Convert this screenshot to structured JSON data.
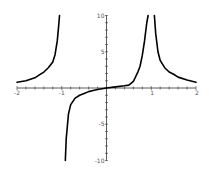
{
  "chart_data": {
    "type": "line",
    "title": "",
    "xlabel": "",
    "ylabel": "",
    "xlim": [
      -2,
      2
    ],
    "ylim": [
      -10,
      10
    ],
    "grid": false,
    "legend": null,
    "x_ticks": [
      "-2",
      "-1",
      "1",
      "2"
    ],
    "y_ticks": [
      "10",
      "5",
      "-5",
      "-10"
    ],
    "vertical_asymptotes": [
      -1,
      1
    ],
    "series": [
      {
        "name": "f(x)",
        "color": "#000000",
        "branches": [
          {
            "x": [
              -2,
              -1.8,
              -1.6,
              -1.5,
              -1.4,
              -1.3,
              -1.2,
              -1.15,
              -1.1,
              -1.07,
              -1.05
            ],
            "y": [
              0.8,
              1.0,
              1.4,
              1.8,
              2.2,
              2.8,
              3.6,
              4.6,
              6.5,
              8.5,
              10
            ]
          },
          {
            "x": [
              -0.92,
              -0.9,
              -0.85,
              -0.8,
              -0.7,
              -0.6,
              -0.5,
              -0.4,
              -0.3,
              -0.2,
              -0.1,
              0
            ],
            "y": [
              -10,
              -7,
              -3.6,
              -2.3,
              -1.4,
              -1.0,
              -0.75,
              -0.5,
              -0.35,
              -0.2,
              -0.1,
              0
            ]
          },
          {
            "x": [
              0,
              0.2,
              0.4,
              0.5,
              0.6,
              0.7,
              0.75,
              0.8,
              0.85,
              0.9,
              0.93
            ],
            "y": [
              0,
              0.15,
              0.3,
              0.4,
              0.9,
              2.2,
              3.0,
              4.5,
              6.5,
              9,
              10
            ]
          },
          {
            "x": [
              1.07,
              1.1,
              1.15,
              1.2,
              1.3,
              1.4,
              1.5,
              1.6,
              1.8,
              2
            ],
            "y": [
              10,
              7.5,
              5.0,
              3.8,
              2.8,
              2.2,
              1.9,
              1.5,
              1.1,
              0.8
            ]
          }
        ]
      }
    ]
  },
  "axes": {
    "x_labels": [
      {
        "text": "-2",
        "x": -2
      },
      {
        "text": "-1",
        "x": -1
      },
      {
        "text": "1",
        "x": 1
      },
      {
        "text": "2",
        "x": 2
      }
    ],
    "y_labels": [
      {
        "text": "10",
        "y": 10
      },
      {
        "text": "5",
        "y": 5
      },
      {
        "text": "-5",
        "y": -5
      },
      {
        "text": "-10",
        "y": -10
      }
    ]
  }
}
